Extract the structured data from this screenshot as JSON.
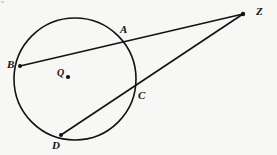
{
  "figure": {
    "width": 277,
    "height": 155,
    "background_color": "#f7f7f5",
    "stroke_color": "#121212"
  },
  "labels": {
    "A": "A",
    "B": "B",
    "C": "C",
    "D": "D",
    "Z": "Z",
    "Q": "Q"
  },
  "geometry": {
    "circle": {
      "cx": 75,
      "cy": 79,
      "r": 61,
      "stroke_width": 1.6
    },
    "center_point": {
      "name": "Q",
      "x": 68,
      "y": 77,
      "dot_radius": 2.1
    },
    "points": [
      {
        "name": "A",
        "x": 125,
        "y": 44,
        "on_circle": true,
        "dot": false
      },
      {
        "name": "B",
        "x": 20,
        "y": 66,
        "on_circle": true,
        "dot": true
      },
      {
        "name": "C",
        "x": 134,
        "y": 89,
        "on_circle": true,
        "dot": false
      },
      {
        "name": "D",
        "x": 61,
        "y": 135,
        "on_circle": true,
        "dot": true
      },
      {
        "name": "Z",
        "x": 243,
        "y": 14,
        "on_circle": false,
        "dot": true
      }
    ],
    "segments": [
      {
        "name": "secant-ZB",
        "from": "Z",
        "to": "B",
        "x1": 243,
        "y1": 14,
        "x2": 20,
        "y2": 66,
        "stroke_width": 1.6
      },
      {
        "name": "secant-ZD",
        "from": "Z",
        "to": "D",
        "x1": 243,
        "y1": 14,
        "x2": 61,
        "y2": 135,
        "stroke_width": 1.6
      }
    ]
  }
}
